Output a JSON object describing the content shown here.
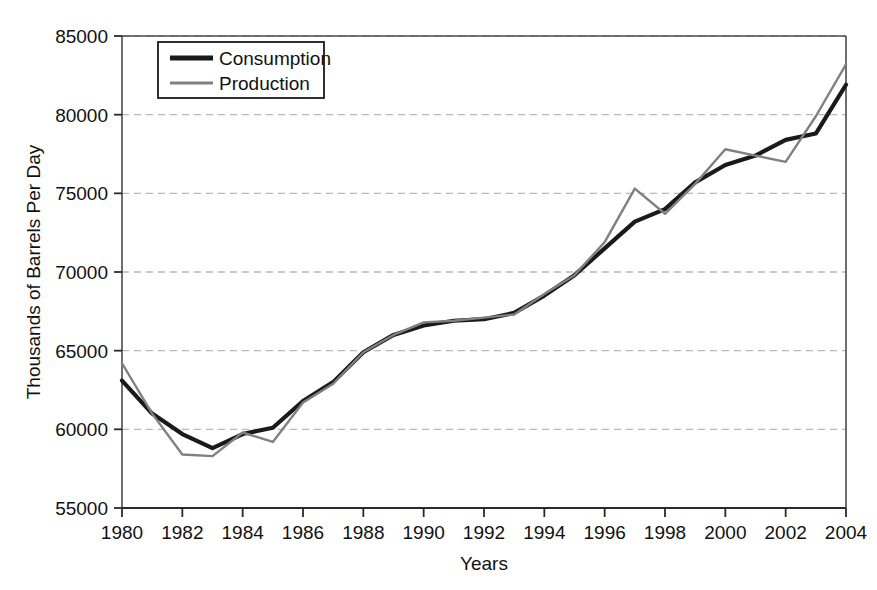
{
  "chart_data": {
    "type": "line",
    "title": "",
    "xlabel": "Years",
    "ylabel": "Thousands of Barrels Per Day",
    "xlim": [
      1980,
      2004
    ],
    "ylim": [
      55000,
      85000
    ],
    "yticks": [
      55000,
      60000,
      65000,
      70000,
      75000,
      80000,
      85000
    ],
    "ytick_labels": [
      "55000",
      "60000",
      "65000",
      "70000",
      "75000",
      "80000",
      "85000"
    ],
    "xticks": [
      1980,
      1982,
      1984,
      1986,
      1988,
      1990,
      1992,
      1994,
      1996,
      1998,
      2000,
      2002,
      2004
    ],
    "xtick_labels": [
      "1980",
      "1982",
      "1984",
      "1986",
      "1988",
      "1990",
      "1992",
      "1994",
      "1996",
      "1998",
      "2000",
      "2002",
      "2004"
    ],
    "grid": "horizontal-dashed",
    "legend_position": "top-left-inside",
    "x": [
      1980,
      1981,
      1982,
      1983,
      1984,
      1985,
      1986,
      1987,
      1988,
      1989,
      1990,
      1991,
      1992,
      1993,
      1994,
      1995,
      1996,
      1997,
      1998,
      1999,
      2000,
      2001,
      2002,
      2003,
      2004
    ],
    "series": [
      {
        "name": "Consumption",
        "color": "#1a1a1a",
        "width": 4.2,
        "values": [
          63100,
          61000,
          59700,
          58800,
          59700,
          60100,
          61800,
          63000,
          64900,
          66000,
          66600,
          66900,
          67000,
          67400,
          68500,
          69800,
          71500,
          73200,
          74000,
          75700,
          76800,
          77400,
          78400,
          78800,
          81900
        ]
      },
      {
        "name": "Production",
        "color": "#808080",
        "width": 2.4,
        "values": [
          64200,
          61000,
          58400,
          58300,
          59800,
          59200,
          61700,
          62900,
          64900,
          66000,
          66800,
          66900,
          67100,
          67300,
          68600,
          69800,
          71900,
          75300,
          73700,
          75600,
          77800,
          77400,
          77000,
          79900,
          83200
        ]
      }
    ]
  },
  "legend": {
    "items": [
      {
        "label": "Consumption"
      },
      {
        "label": "Production"
      }
    ]
  }
}
